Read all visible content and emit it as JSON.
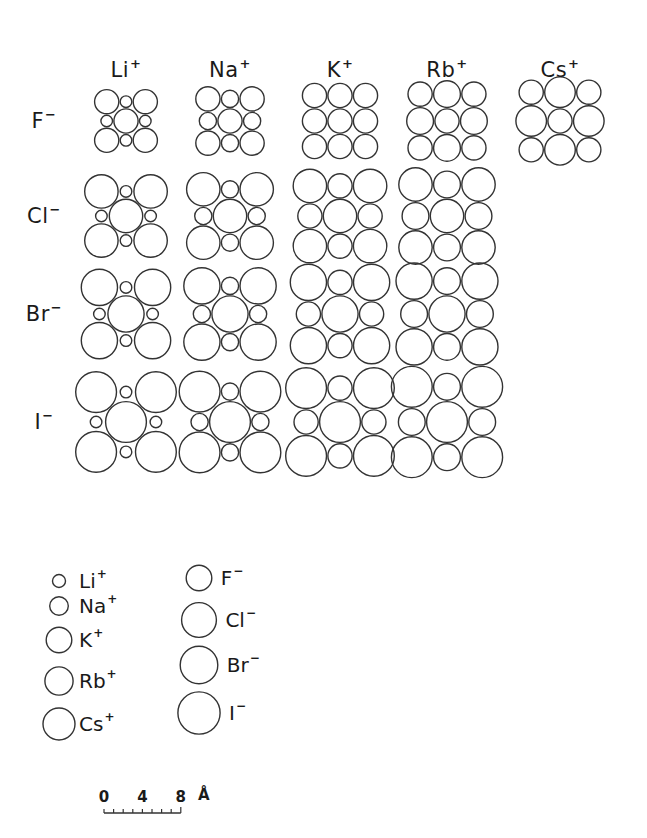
{
  "figure": {
    "px_per_angstrom": 9.6,
    "stroke_color": "#333333",
    "cations": [
      {
        "symbol": "Li",
        "charge": "+",
        "radius_A": 0.68,
        "col_x": 126
      },
      {
        "symbol": "Na",
        "charge": "+",
        "radius_A": 0.97,
        "col_x": 230
      },
      {
        "symbol": "K",
        "charge": "+",
        "radius_A": 1.33,
        "col_x": 340
      },
      {
        "symbol": "Rb",
        "charge": "+",
        "radius_A": 1.47,
        "col_x": 447
      },
      {
        "symbol": "Cs",
        "charge": "+",
        "radius_A": 1.67,
        "col_x": 560
      }
    ],
    "anions": [
      {
        "symbol": "F",
        "charge": "−",
        "radius_A": 1.33,
        "row_y": 121
      },
      {
        "symbol": "Cl",
        "charge": "−",
        "radius_A": 1.81,
        "row_y": 216
      },
      {
        "symbol": "Br",
        "charge": "−",
        "radius_A": 1.96,
        "row_y": 314
      },
      {
        "symbol": "I",
        "charge": "−",
        "radius_A": 2.2,
        "row_y": 422
      }
    ],
    "header_y": 70,
    "row_label_x": 44,
    "cells": [
      {
        "cation": "Li",
        "anion": "F"
      },
      {
        "cation": "Na",
        "anion": "F"
      },
      {
        "cation": "K",
        "anion": "F"
      },
      {
        "cation": "Rb",
        "anion": "F"
      },
      {
        "cation": "Cs",
        "anion": "F"
      },
      {
        "cation": "Li",
        "anion": "Cl"
      },
      {
        "cation": "Na",
        "anion": "Cl"
      },
      {
        "cation": "K",
        "anion": "Cl"
      },
      {
        "cation": "Rb",
        "anion": "Cl"
      },
      {
        "cation": "Li",
        "anion": "Br"
      },
      {
        "cation": "Na",
        "anion": "Br"
      },
      {
        "cation": "K",
        "anion": "Br"
      },
      {
        "cation": "Rb",
        "anion": "Br"
      },
      {
        "cation": "Li",
        "anion": "I"
      },
      {
        "cation": "Na",
        "anion": "I"
      },
      {
        "cation": "K",
        "anion": "I"
      },
      {
        "cation": "Rb",
        "anion": "I"
      }
    ]
  },
  "legend": {
    "cations": [
      {
        "symbol": "Li",
        "charge": "+",
        "cx": 59,
        "cy": 581
      },
      {
        "symbol": "Na",
        "charge": "+",
        "cx": 59,
        "cy": 606
      },
      {
        "symbol": "K",
        "charge": "+",
        "cx": 59,
        "cy": 640
      },
      {
        "symbol": "Rb",
        "charge": "+",
        "cx": 59,
        "cy": 681
      },
      {
        "symbol": "Cs",
        "charge": "+",
        "cx": 59,
        "cy": 724
      }
    ],
    "anions": [
      {
        "symbol": "F",
        "charge": "−",
        "cx": 199,
        "cy": 578
      },
      {
        "symbol": "Cl",
        "charge": "−",
        "cx": 199,
        "cy": 620
      },
      {
        "symbol": "Br",
        "charge": "−",
        "cx": 199,
        "cy": 665
      },
      {
        "symbol": "I",
        "charge": "−",
        "cx": 199,
        "cy": 713
      }
    ]
  },
  "scale_bar": {
    "labels": [
      "0",
      "4",
      "8"
    ],
    "unit": "Å",
    "max_A": 8,
    "x0": 104,
    "y_labels": 797,
    "y_bar": 813,
    "ticks": 8
  }
}
